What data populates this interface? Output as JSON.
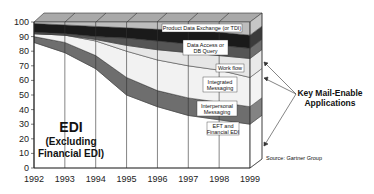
{
  "chart_data": {
    "type": "area",
    "stacked": true,
    "title": "",
    "xlabel": "",
    "ylabel": "",
    "x": [
      1992,
      1993,
      1994,
      1995,
      1996,
      1997,
      1998,
      1999
    ],
    "ylim": [
      0,
      100
    ],
    "yticks": [
      0,
      10,
      20,
      30,
      40,
      50,
      60,
      70,
      80,
      90,
      100
    ],
    "grid": "vertical lines at each year",
    "series": [
      {
        "name": "EDI (Excluding Financial EDI)",
        "values": [
          86,
          79,
          68,
          50,
          42,
          36,
          33,
          30
        ],
        "color": "#ffffff"
      },
      {
        "name": "EFT and Financial EDI",
        "values": [
          4,
          7,
          9,
          12,
          11,
          12,
          12,
          12
        ],
        "color": "#6e6e6e"
      },
      {
        "name": "Interpersonal Messaging",
        "values": [
          2,
          5,
          10,
          18,
          21,
          22,
          22,
          20
        ],
        "color": "#f2f2f2"
      },
      {
        "name": "Integrated Messaging",
        "values": [
          0,
          0,
          1,
          4,
          7,
          9,
          10,
          13
        ],
        "color": "#e6e6e6"
      },
      {
        "name": "Work flow",
        "values": [
          1,
          1,
          2,
          5,
          6,
          6,
          7,
          7
        ],
        "color": "#555555"
      },
      {
        "name": "Data Access or DB Query",
        "values": [
          6,
          6,
          7,
          7,
          8,
          9,
          9,
          9
        ],
        "color": "#1a1a1a"
      },
      {
        "name": "Product Data Exchange (or TDI)",
        "values": [
          1,
          2,
          3,
          4,
          5,
          6,
          7,
          9
        ],
        "color": "#bdbdbd"
      }
    ],
    "annotations": [
      "EDI (Excluding Financial EDI)",
      "Key Mail-Enable Applications",
      "Source: Gartner Group"
    ]
  },
  "labels": {
    "edi_line1": "EDI",
    "edi_line2": "(Excluding",
    "edi_line3": "Financial EDI)",
    "pde": "Product Data Exchange (or TDI)",
    "da1": "Data Access or",
    "da2": "DB Query",
    "wf": "Work flow",
    "im1": "Integrated",
    "im2": "Messaging",
    "ip1": "Interpersonal",
    "ip2": "Messaging",
    "eft1": "EFT and",
    "eft2": "Financial EDI",
    "key1": "Key Mail-Enable",
    "key2": "Applications",
    "source": "Source: Gartner Group"
  },
  "axis": {
    "y": [
      "0",
      "10",
      "20",
      "30",
      "40",
      "50",
      "60",
      "70",
      "80",
      "90",
      "100"
    ],
    "x": [
      "1992",
      "1993",
      "1994",
      "1995",
      "1996",
      "1997",
      "1998",
      "1999"
    ]
  }
}
